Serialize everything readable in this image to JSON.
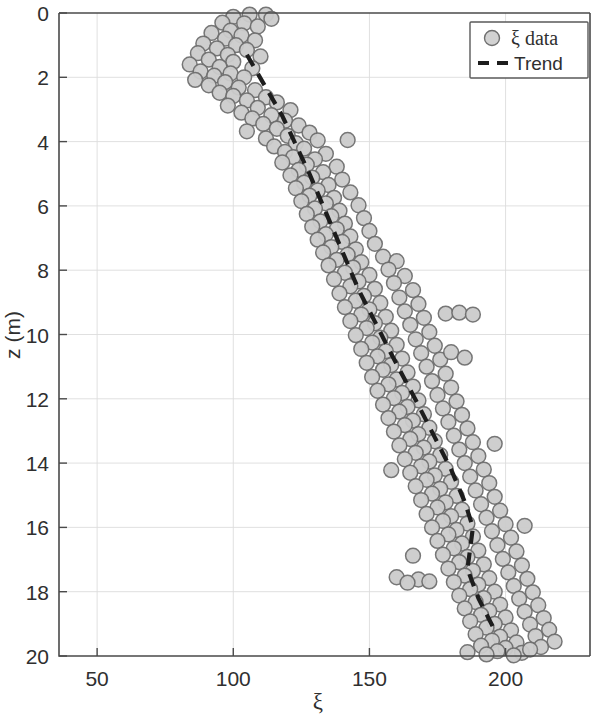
{
  "chart_data": {
    "type": "scatter",
    "title": "",
    "xlabel": "ξ",
    "ylabel": "z (m)",
    "xlim": [
      36,
      231
    ],
    "ylim": [
      0,
      20
    ],
    "y_inverted": true,
    "grid": true,
    "legend_position": "top-right",
    "xticks": [
      50,
      100,
      150,
      200
    ],
    "xtick_labels": [
      "50",
      "100",
      "150",
      "200"
    ],
    "yticks": [
      0,
      2,
      4,
      6,
      8,
      10,
      12,
      14,
      16,
      18,
      20
    ],
    "ytick_labels": [
      "0",
      "2",
      "4",
      "6",
      "8",
      "10",
      "12",
      "14",
      "16",
      "18",
      "20"
    ],
    "series": [
      {
        "name": "ξ data",
        "type": "scatter",
        "marker": "circle",
        "marker_face_color": "#cccccc",
        "marker_edge_color": "#6f6f6f",
        "points": [
          [
            106,
            0.05
          ],
          [
            112,
            0.05
          ],
          [
            100,
            0.12
          ],
          [
            114,
            0.18
          ],
          [
            96,
            0.3
          ],
          [
            104,
            0.32
          ],
          [
            109,
            0.42
          ],
          [
            99,
            0.55
          ],
          [
            92,
            0.62
          ],
          [
            103,
            0.7
          ],
          [
            97,
            0.8
          ],
          [
            108,
            0.85
          ],
          [
            89,
            0.95
          ],
          [
            101,
            1.0
          ],
          [
            94,
            1.1
          ],
          [
            105,
            1.15
          ],
          [
            87,
            1.25
          ],
          [
            98,
            1.3
          ],
          [
            110,
            1.35
          ],
          [
            91,
            1.45
          ],
          [
            100,
            1.52
          ],
          [
            84,
            1.6
          ],
          [
            95,
            1.68
          ],
          [
            107,
            1.72
          ],
          [
            88,
            1.82
          ],
          [
            99,
            1.88
          ],
          [
            93,
            1.95
          ],
          [
            104,
            2.0
          ],
          [
            86,
            2.08
          ],
          [
            97,
            2.15
          ],
          [
            91,
            2.25
          ],
          [
            102,
            2.32
          ],
          [
            108,
            2.4
          ],
          [
            95,
            2.48
          ],
          [
            100,
            2.58
          ],
          [
            112,
            2.62
          ],
          [
            105,
            2.72
          ],
          [
            116,
            2.78
          ],
          [
            98,
            2.88
          ],
          [
            109,
            2.95
          ],
          [
            121,
            3.02
          ],
          [
            103,
            3.1
          ],
          [
            114,
            3.18
          ],
          [
            107,
            3.28
          ],
          [
            119,
            3.35
          ],
          [
            111,
            3.45
          ],
          [
            124,
            3.5
          ],
          [
            116,
            3.6
          ],
          [
            105,
            3.68
          ],
          [
            128,
            3.72
          ],
          [
            120,
            3.82
          ],
          [
            112,
            3.9
          ],
          [
            131,
            3.96
          ],
          [
            123,
            4.05
          ],
          [
            142,
            3.95
          ],
          [
            115,
            4.15
          ],
          [
            126,
            4.22
          ],
          [
            119,
            4.32
          ],
          [
            134,
            4.38
          ],
          [
            122,
            4.48
          ],
          [
            130,
            4.55
          ],
          [
            118,
            4.65
          ],
          [
            127,
            4.72
          ],
          [
            138,
            4.78
          ],
          [
            124,
            4.88
          ],
          [
            133,
            4.95
          ],
          [
            121,
            5.05
          ],
          [
            129,
            5.12
          ],
          [
            140,
            5.18
          ],
          [
            126,
            5.28
          ],
          [
            135,
            5.35
          ],
          [
            123,
            5.45
          ],
          [
            131,
            5.52
          ],
          [
            143,
            5.58
          ],
          [
            128,
            5.68
          ],
          [
            137,
            5.75
          ],
          [
            125,
            5.85
          ],
          [
            134,
            5.92
          ],
          [
            146,
            5.98
          ],
          [
            130,
            6.08
          ],
          [
            139,
            6.15
          ],
          [
            127,
            6.25
          ],
          [
            136,
            6.32
          ],
          [
            148,
            6.38
          ],
          [
            132,
            6.48
          ],
          [
            141,
            6.55
          ],
          [
            129,
            6.65
          ],
          [
            138,
            6.72
          ],
          [
            150,
            6.78
          ],
          [
            134,
            6.88
          ],
          [
            143,
            6.95
          ],
          [
            131,
            7.05
          ],
          [
            140,
            7.12
          ],
          [
            152,
            7.18
          ],
          [
            136,
            7.28
          ],
          [
            145,
            7.35
          ],
          [
            133,
            7.45
          ],
          [
            142,
            7.52
          ],
          [
            155,
            7.58
          ],
          [
            138,
            7.68
          ],
          [
            147,
            7.75
          ],
          [
            160,
            7.72
          ],
          [
            135,
            7.85
          ],
          [
            144,
            7.92
          ],
          [
            157,
            7.98
          ],
          [
            141,
            8.08
          ],
          [
            150,
            8.15
          ],
          [
            163,
            8.18
          ],
          [
            137,
            8.28
          ],
          [
            146,
            8.35
          ],
          [
            159,
            8.4
          ],
          [
            143,
            8.5
          ],
          [
            152,
            8.58
          ],
          [
            166,
            8.62
          ],
          [
            139,
            8.72
          ],
          [
            148,
            8.8
          ],
          [
            161,
            8.85
          ],
          [
            145,
            8.95
          ],
          [
            154,
            9.02
          ],
          [
            168,
            9.05
          ],
          [
            141,
            9.15
          ],
          [
            150,
            9.22
          ],
          [
            163,
            9.28
          ],
          [
            147,
            9.38
          ],
          [
            156,
            9.45
          ],
          [
            170,
            9.48
          ],
          [
            143,
            9.58
          ],
          [
            152,
            9.65
          ],
          [
            165,
            9.7
          ],
          [
            178,
            9.35
          ],
          [
            183,
            9.32
          ],
          [
            188,
            9.38
          ],
          [
            149,
            9.8
          ],
          [
            158,
            9.88
          ],
          [
            172,
            9.92
          ],
          [
            145,
            10.02
          ],
          [
            154,
            10.1
          ],
          [
            167,
            10.15
          ],
          [
            151,
            10.25
          ],
          [
            160,
            10.32
          ],
          [
            174,
            10.35
          ],
          [
            147,
            10.45
          ],
          [
            156,
            10.52
          ],
          [
            169,
            10.58
          ],
          [
            153,
            10.68
          ],
          [
            162,
            10.75
          ],
          [
            176,
            10.78
          ],
          [
            149,
            10.88
          ],
          [
            158,
            10.95
          ],
          [
            171,
            11.0
          ],
          [
            180,
            10.55
          ],
          [
            185,
            10.72
          ],
          [
            155,
            11.1
          ],
          [
            164,
            11.18
          ],
          [
            178,
            11.22
          ],
          [
            151,
            11.32
          ],
          [
            160,
            11.4
          ],
          [
            173,
            11.45
          ],
          [
            157,
            11.55
          ],
          [
            166,
            11.62
          ],
          [
            180,
            11.65
          ],
          [
            153,
            11.75
          ],
          [
            162,
            11.82
          ],
          [
            175,
            11.88
          ],
          [
            159,
            11.98
          ],
          [
            168,
            12.05
          ],
          [
            182,
            12.08
          ],
          [
            155,
            12.18
          ],
          [
            164,
            12.25
          ],
          [
            177,
            12.3
          ],
          [
            161,
            12.4
          ],
          [
            170,
            12.48
          ],
          [
            184,
            12.5
          ],
          [
            157,
            12.6
          ],
          [
            166,
            12.68
          ],
          [
            179,
            12.72
          ],
          [
            163,
            12.82
          ],
          [
            172,
            12.9
          ],
          [
            186,
            12.92
          ],
          [
            159,
            13.02
          ],
          [
            168,
            13.1
          ],
          [
            181,
            13.15
          ],
          [
            165,
            13.25
          ],
          [
            174,
            13.32
          ],
          [
            188,
            13.35
          ],
          [
            161,
            13.45
          ],
          [
            170,
            13.52
          ],
          [
            183,
            13.58
          ],
          [
            196,
            13.4
          ],
          [
            167,
            13.68
          ],
          [
            176,
            13.75
          ],
          [
            190,
            13.78
          ],
          [
            163,
            13.88
          ],
          [
            172,
            13.95
          ],
          [
            185,
            14.0
          ],
          [
            169,
            14.1
          ],
          [
            178,
            14.18
          ],
          [
            192,
            14.2
          ],
          [
            158,
            14.22
          ],
          [
            165,
            14.3
          ],
          [
            174,
            14.38
          ],
          [
            187,
            14.42
          ],
          [
            171,
            14.52
          ],
          [
            180,
            14.58
          ],
          [
            194,
            14.62
          ],
          [
            167,
            14.72
          ],
          [
            176,
            14.8
          ],
          [
            189,
            14.85
          ],
          [
            173,
            14.95
          ],
          [
            182,
            15.02
          ],
          [
            196,
            15.05
          ],
          [
            169,
            15.15
          ],
          [
            178,
            15.22
          ],
          [
            191,
            15.28
          ],
          [
            175,
            15.38
          ],
          [
            184,
            15.45
          ],
          [
            198,
            15.48
          ],
          [
            171,
            15.58
          ],
          [
            180,
            15.65
          ],
          [
            193,
            15.7
          ],
          [
            177,
            15.8
          ],
          [
            186,
            15.88
          ],
          [
            200,
            15.9
          ],
          [
            207,
            15.95
          ],
          [
            173,
            16.0
          ],
          [
            182,
            16.08
          ],
          [
            195,
            16.12
          ],
          [
            179,
            16.22
          ],
          [
            188,
            16.28
          ],
          [
            202,
            16.32
          ],
          [
            175,
            16.42
          ],
          [
            184,
            16.5
          ],
          [
            197,
            16.55
          ],
          [
            166,
            16.88
          ],
          [
            181,
            16.65
          ],
          [
            190,
            16.72
          ],
          [
            204,
            16.75
          ],
          [
            177,
            16.85
          ],
          [
            186,
            16.92
          ],
          [
            199,
            16.98
          ],
          [
            183,
            17.08
          ],
          [
            192,
            17.15
          ],
          [
            206,
            17.18
          ],
          [
            179,
            17.28
          ],
          [
            188,
            17.35
          ],
          [
            201,
            17.4
          ],
          [
            185,
            17.5
          ],
          [
            194,
            17.58
          ],
          [
            208,
            17.6
          ],
          [
            181,
            17.7
          ],
          [
            190,
            17.78
          ],
          [
            203,
            17.82
          ],
          [
            160,
            17.55
          ],
          [
            168,
            17.62
          ],
          [
            164,
            17.72
          ],
          [
            172,
            17.68
          ],
          [
            187,
            17.92
          ],
          [
            196,
            18.0
          ],
          [
            210,
            18.02
          ],
          [
            183,
            18.12
          ],
          [
            192,
            18.2
          ],
          [
            205,
            18.22
          ],
          [
            189,
            18.32
          ],
          [
            198,
            18.4
          ],
          [
            212,
            18.42
          ],
          [
            185,
            18.52
          ],
          [
            194,
            18.6
          ],
          [
            207,
            18.62
          ],
          [
            191,
            18.72
          ],
          [
            200,
            18.8
          ],
          [
            214,
            18.82
          ],
          [
            187,
            18.92
          ],
          [
            196,
            19.0
          ],
          [
            209,
            19.02
          ],
          [
            193,
            19.12
          ],
          [
            202,
            19.2
          ],
          [
            216,
            19.18
          ],
          [
            189,
            19.32
          ],
          [
            198,
            19.4
          ],
          [
            211,
            19.38
          ],
          [
            195,
            19.52
          ],
          [
            204,
            19.58
          ],
          [
            218,
            19.55
          ],
          [
            191,
            19.68
          ],
          [
            200,
            19.75
          ],
          [
            213,
            19.72
          ],
          [
            197,
            19.85
          ],
          [
            206,
            19.9
          ],
          [
            203,
            19.98
          ],
          [
            193,
            19.95
          ],
          [
            186,
            19.88
          ],
          [
            209,
            19.8
          ]
        ]
      },
      {
        "name": "Trend",
        "type": "line",
        "style": "dashed",
        "color": "#1d1d1d",
        "points": [
          [
            105,
            1.3
          ],
          [
            118,
            3.2
          ],
          [
            128,
            5.0
          ],
          [
            136,
            6.6
          ],
          [
            142,
            7.8
          ],
          [
            146,
            8.6
          ],
          [
            152,
            9.6
          ],
          [
            158,
            10.6
          ],
          [
            163,
            11.4
          ],
          [
            168,
            12.2
          ],
          [
            174,
            13.2
          ],
          [
            180,
            14.2
          ],
          [
            185,
            15.2
          ],
          [
            188,
            16.0
          ],
          [
            186,
            17.3
          ],
          [
            190,
            18.2
          ],
          [
            196,
            19.2
          ]
        ]
      }
    ]
  },
  "legend": {
    "items": [
      {
        "label": "ξ data",
        "marker": "circle-marker"
      },
      {
        "label": "Trend",
        "marker": "dashed-line"
      }
    ]
  },
  "axes": {
    "x_title": "ξ",
    "y_title": "z (m)"
  }
}
